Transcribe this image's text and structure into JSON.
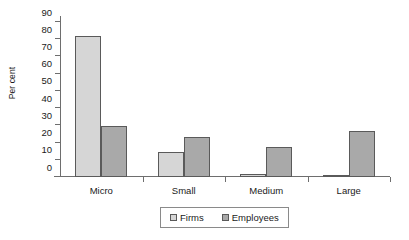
{
  "chart_data": {
    "type": "bar",
    "title": "",
    "subtitle": "",
    "xlabel": "",
    "ylabel": "Per cent",
    "categories": [
      "Micro",
      "Small",
      "Medium",
      "Large"
    ],
    "series": [
      {
        "name": "Firms",
        "color": "#d6d6d6",
        "values": [
          82,
          14.5,
          2,
          0.7
        ]
      },
      {
        "name": "Employees",
        "color": "#a9a9a9",
        "values": [
          29.5,
          23.5,
          17.5,
          27
        ]
      }
    ],
    "ylim": [
      0,
      90
    ],
    "ytick_step": 10,
    "ytick_labels": [
      "0",
      "10",
      "20",
      "30",
      "40",
      "50",
      "60",
      "70",
      "80",
      "90"
    ],
    "grid": false,
    "legend_position": "bottom-center",
    "legend_border": true,
    "bar_edge_color": "#5a5a5a",
    "axis_color": "#6e6e6e"
  }
}
